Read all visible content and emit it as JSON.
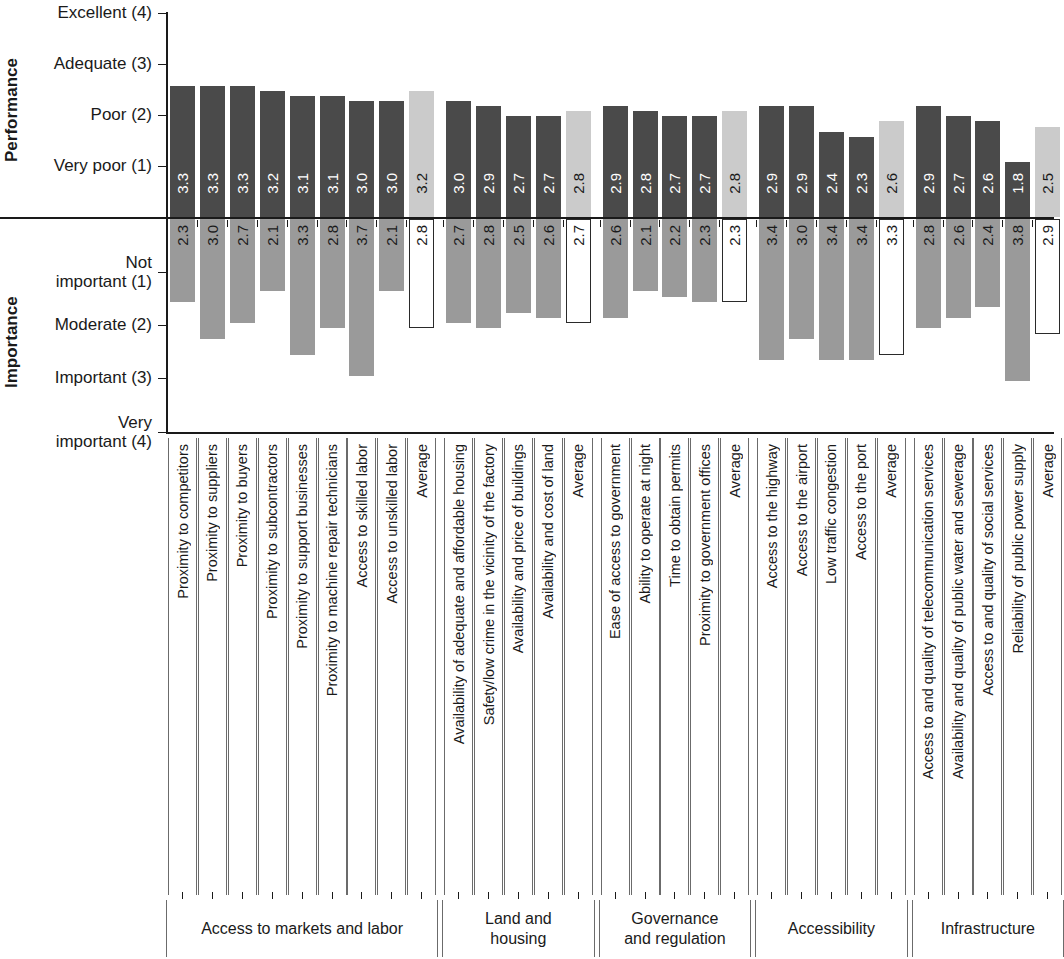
{
  "axes": {
    "performance": {
      "title": "Performance",
      "ticks": [
        "Excellent (4)",
        "Adequate (3)",
        "Poor (2)",
        "Very poor (1)"
      ]
    },
    "importance": {
      "title": "Importance",
      "ticks": [
        "Not\nimportant (1)",
        "Moderate (2)",
        "Important (3)",
        "Very\nimportant (4)"
      ]
    }
  },
  "colors": {
    "performance_bar": "#4a4a4a",
    "importance_bar": "#9a9a9a",
    "performance_average_bar": "#cbcbcb",
    "importance_average_bar": "#ffffff",
    "average_outline": "#2a2a2a",
    "axis": "#1a1a1a"
  },
  "chart_data": {
    "type": "bar",
    "title": "",
    "xlabel": "",
    "ylabel": "",
    "orientation": "vertical-mirrored",
    "grid": false,
    "legend": "none",
    "performance_ylim": [
      1,
      4
    ],
    "importance_ylim": [
      1,
      4
    ],
    "performance_scale": [
      "Very poor (1)",
      "Poor (2)",
      "Adequate (3)",
      "Excellent (4)"
    ],
    "importance_scale": [
      "Not important (1)",
      "Moderate (2)",
      "Important (3)",
      "Very important (4)"
    ],
    "series": [
      {
        "name": "Performance",
        "values": [
          3.3,
          3.3,
          3.3,
          3.2,
          3.1,
          3.1,
          3.0,
          3.0,
          3.2,
          3.0,
          2.9,
          2.7,
          2.7,
          2.8,
          2.9,
          2.8,
          2.7,
          2.7,
          2.8,
          2.9,
          2.9,
          2.4,
          2.3,
          2.6,
          2.9,
          2.7,
          2.6,
          1.8,
          2.5
        ]
      },
      {
        "name": "Importance",
        "values": [
          2.3,
          3.0,
          2.7,
          2.1,
          3.3,
          2.8,
          3.7,
          2.1,
          2.8,
          2.7,
          2.8,
          2.5,
          2.6,
          2.7,
          2.6,
          2.1,
          2.2,
          2.3,
          2.3,
          3.4,
          3.0,
          3.4,
          3.4,
          3.3,
          2.8,
          2.6,
          2.4,
          3.8,
          2.9
        ]
      }
    ],
    "categories": [
      "Proximity to competitors",
      "Proximity to suppliers",
      "Proximity to buyers",
      "Proximity to subcontractors",
      "Proximity to support businesses",
      "Proximity to machine repair technicians",
      "Access to skilled labor",
      "Access to unskilled labor",
      "Average",
      "Availability of adequate and affordable housing",
      "Safety/low crime in the vicinity of the factory",
      "Availability and price of buildings",
      "Availability and cost of land",
      "Average",
      "Ease of access to government",
      "Ability to operate at night",
      "Time to obtain permits",
      "Proximity to government offices",
      "Average",
      "Access to the highway",
      "Access to the airport",
      "Low traffic congestion",
      "Access to the port",
      "Average",
      "Access to and quality of telecommunication services",
      "Availability and quality of public water and sewerage",
      "Access to and quality of social services",
      "Reliability of public power supply",
      "Average"
    ],
    "is_average": [
      false,
      false,
      false,
      false,
      false,
      false,
      false,
      false,
      true,
      false,
      false,
      false,
      false,
      true,
      false,
      false,
      false,
      false,
      true,
      false,
      false,
      false,
      false,
      true,
      false,
      false,
      false,
      false,
      true
    ],
    "groups": [
      {
        "label": "Access to markets and labor",
        "start": 0,
        "count": 9
      },
      {
        "label": "Land and\nhousing",
        "start": 9,
        "count": 5
      },
      {
        "label": "Governance\nand regulation",
        "start": 14,
        "count": 5
      },
      {
        "label": "Accessibility",
        "start": 19,
        "count": 5
      },
      {
        "label": "Infrastructure",
        "start": 24,
        "count": 5
      }
    ]
  }
}
